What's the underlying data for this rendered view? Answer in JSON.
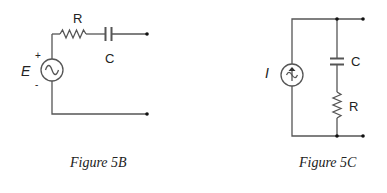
{
  "figures": [
    {
      "id": "5B",
      "caption": "Figure 5B",
      "source": {
        "label": "E",
        "type": "ac-voltage-source",
        "plus": "+",
        "minus": "-"
      },
      "components": [
        {
          "label": "R",
          "type": "resistor",
          "connection": "series"
        },
        {
          "label": "C",
          "type": "capacitor",
          "connection": "series"
        }
      ],
      "terminals": 2
    },
    {
      "id": "5C",
      "caption": "Figure 5C",
      "source": {
        "label": "I",
        "type": "ac-current-source"
      },
      "components": [
        {
          "label": "C",
          "type": "capacitor",
          "connection": "series-branch"
        },
        {
          "label": "R",
          "type": "resistor",
          "connection": "series-branch"
        }
      ],
      "terminals": 2
    }
  ],
  "colors": {
    "wire": "#555555",
    "text": "#222222",
    "background": "#ffffff"
  }
}
